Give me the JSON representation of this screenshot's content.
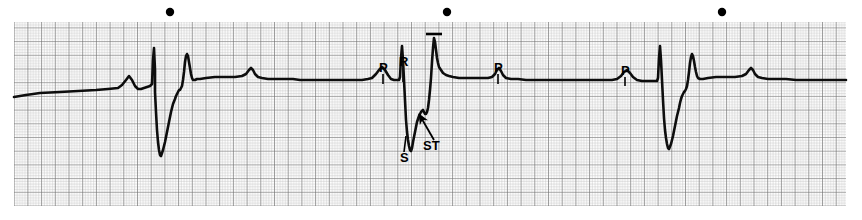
{
  "figure": {
    "kind": "ecg-rhythm-strip",
    "title": "",
    "background_color": "#ffffff",
    "width": 862,
    "height": 220
  },
  "grid": {
    "name": "ecg-graph-paper",
    "x": 14,
    "y": 22,
    "width": 832,
    "height": 184,
    "small_box_px": 2.74,
    "large_box_px": 13.7,
    "fine_line_color": "#bcbcbc",
    "bold_line_color": "#6f6f6f",
    "paper_color": "#ffffff",
    "small_boxes_per_large": 5
  },
  "trace": {
    "name": "ecg-waveform",
    "color": "#0d0d0d",
    "stroke_width": 2.6,
    "baseline_y": 93,
    "lead_note": ""
  },
  "markers": {
    "name": "beat-markers",
    "color": "#000000",
    "radius": 4.2,
    "y": 12,
    "x_positions": [
      170,
      447,
      722
    ]
  },
  "calibration": {
    "name": "t-wave-peak-marker",
    "x": 434,
    "y_top": 34,
    "half_width": 8,
    "color": "#000000"
  },
  "annotations": [
    {
      "id": "p1",
      "text": "P",
      "x": 379,
      "y": 72,
      "name": "label-p-wave-1"
    },
    {
      "id": "r1",
      "text": "R",
      "x": 399,
      "y": 66,
      "name": "label-r-wave"
    },
    {
      "id": "s1",
      "text": "S",
      "x": 400,
      "y": 162,
      "name": "label-s-wave"
    },
    {
      "id": "st",
      "text": "ST",
      "x": 423,
      "y": 150,
      "name": "label-st-segment"
    },
    {
      "id": "p2",
      "text": "P",
      "x": 494,
      "y": 72,
      "name": "label-p-wave-2"
    },
    {
      "id": "p3",
      "text": "P",
      "x": 621,
      "y": 75,
      "name": "label-p-wave-3"
    }
  ],
  "leader_lines": [
    {
      "name": "leader-line-p1",
      "x1": 383,
      "y1": 74,
      "x2": 383,
      "y2": 84
    },
    {
      "name": "leader-line-r",
      "x1": 403,
      "y1": 68,
      "x2": 403,
      "y2": 82
    },
    {
      "name": "leader-line-s",
      "x1": 406,
      "y1": 136,
      "x2": 404,
      "y2": 152
    },
    {
      "name": "leader-line-p2",
      "x1": 498,
      "y1": 74,
      "x2": 498,
      "y2": 84
    },
    {
      "name": "leader-line-p3",
      "x1": 625,
      "y1": 77,
      "x2": 625,
      "y2": 86
    }
  ],
  "arrows": [
    {
      "name": "arrow-st-segment",
      "x1": 434,
      "y1": 140,
      "x2": 419,
      "y2": 114
    }
  ],
  "chart_data": {
    "type": "line",
    "title": "",
    "xlabel": "",
    "ylabel": "",
    "series": [
      {
        "name": "ecg-lead-trace",
        "points": "14,97 26,95 40,93 60,92 78,91 96,90 108,89 118,88 122,85 126,80 129,76 132,80 135,86 138,89 141,89 144,88 147,87 150,86 152,84 153,60 154,48 155,70 155,92 156,112 157,130 158,142 159,150 160,155 161,156 163,150 165,142 167,132 169,122 171,112 173,104 175,99 176,96 177,94 178,92 179,90 180,90 181,88 182,86 183,80 184,72 185,62 186,56 187,54 188,56 189,62 190,68 191,74 192,78 193,80 195,80 197,79 200,79 206,78 215,77 225,77 235,77 242,76 246,74 249,70 251,68 253,70 255,74 258,77 262,78 268,79 275,79 284,79 293,79 300,80 308,80 315,80 322,80 330,80 338,80 346,80 354,80 362,80 368,79 372,78 376,74 379,70 382,67 385,70 388,75 391,79 394,80 397,80 399,80 400,77 401,58 402,46 403,60 404,80 405,100 406,120 407,132 408,140 409,146 410,150 411,151 412,148 413,142 415,132 417,122 419,116 421,112 423,110 424,112 425,114 426,114 427,112 428,108 429,100 430,90 431,78 432,62 433,48 434,38 435,42 436,50 437,58 438,63 439,67 441,70 443,73 446,75 449,76 453,77 459,78 466,78 474,78 482,78 488,78 492,77 495,74 497,70 499,68 501,71 503,75 506,78 511,79 518,79 526,80 535,80 545,80 555,80 565,80 575,80 585,80 595,80 605,80 612,80 617,79 621,76 624,72 627,70 630,73 633,77 637,80 642,81 648,81 652,81 655,81 657,81 658,78 659,58 660,46 661,60 662,80 663,100 664,118 665,130 666,138 667,144 668,148 669,149 671,144 673,136 675,126 677,116 679,108 680,103 681,99 682,96 683,94 684,92 685,91 686,89 687,86 688,80 689,72 690,63 691,57 692,54 693,56 694,61 695,67 696,72 697,76 698,78 700,79 703,79 708,78 716,77 725,77 735,77 742,76 746,74 749,70 751,68 753,70 755,74 758,77 762,78 768,79 776,79 786,79 796,80 806,80 816,80 826,80 836,80 846,80",
        "color": "#0d0d0d"
      }
    ],
    "annotations": [
      "P",
      "R",
      "S",
      "ST",
      "P",
      "P"
    ],
    "grid": true,
    "legend": "none"
  }
}
